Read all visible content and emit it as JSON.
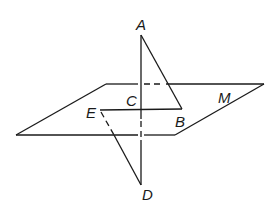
{
  "diagram": {
    "type": "3d-geometry",
    "colors": {
      "stroke": "#1a1a1a",
      "background": "#ffffff"
    },
    "plane": {
      "label": "M"
    },
    "points": [
      {
        "id": "A",
        "label": "A"
      },
      {
        "id": "B",
        "label": "B"
      },
      {
        "id": "C",
        "label": "C"
      },
      {
        "id": "D",
        "label": "D"
      },
      {
        "id": "E",
        "label": "E"
      }
    ]
  }
}
